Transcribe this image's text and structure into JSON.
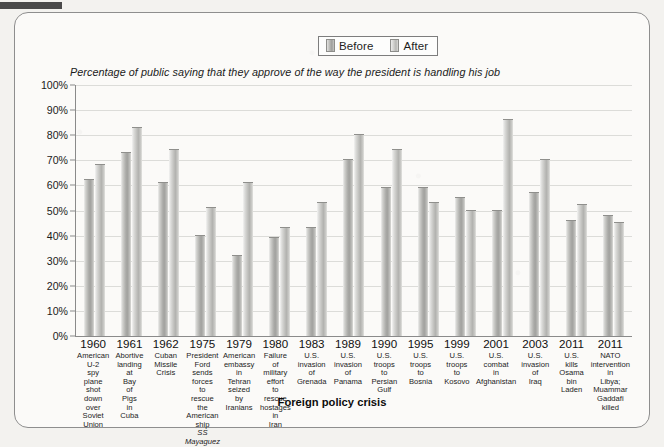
{
  "figure": {
    "subtitle": "Percentage of public saying that they approve of the way the president is handling his job",
    "xaxis_title": "Foreign policy crisis",
    "legend": [
      {
        "label": "Before",
        "color": "#b0b0ad"
      },
      {
        "label": "After",
        "color": "#c2c2bf"
      }
    ]
  },
  "chart_data": {
    "type": "bar",
    "title": "",
    "subtitle": "Percentage of public saying that they approve of the way the president is handling his job",
    "xlabel": "Foreign policy crisis",
    "ylabel": "",
    "ylim": [
      0,
      100
    ],
    "ytick_labels": [
      "0%",
      "10%",
      "20%",
      "30%",
      "40%",
      "50%",
      "60%",
      "70%",
      "80%",
      "90%",
      "100%"
    ],
    "ytick_values": [
      0,
      10,
      20,
      30,
      40,
      50,
      60,
      70,
      80,
      90,
      100
    ],
    "grid": true,
    "legend_position": "top-center",
    "categories": [
      "1960 American U-2 spy plane shot down over Soviet Union",
      "1961 Abortive landing at Bay of Pigs in Cuba",
      "1962 Cuban Missile Crisis",
      "1975 President Ford sends forces to rescue the American ship SS Mayaguez",
      "1979 American embassy in Tehran seized by Iranians",
      "1980 Failure of military effort to rescue hostages in Iran",
      "1983 U.S. invasion of Grenada",
      "1989 U.S. invasion of Panama",
      "1990 U.S. troops to Persian Gulf",
      "1995 U.S. troops to Bosnia",
      "1999 U.S. troops to Kosovo",
      "2001 U.S. combat in Afghanistan",
      "2003 U.S. invasion of Iraq",
      "2011 U.S. kills Osama bin Laden",
      "2011 NATO intervention in Libya; Muammar Gaddafi killed"
    ],
    "category_years": [
      "1960",
      "1961",
      "1962",
      "1975",
      "1979",
      "1980",
      "1983",
      "1989",
      "1990",
      "1995",
      "1999",
      "2001",
      "2003",
      "2011",
      "2011"
    ],
    "category_descriptions": [
      "American U-2 spy plane shot down over Soviet Union",
      "Abortive landing at Bay of Pigs in Cuba",
      "Cuban Missile Crisis",
      "President Ford sends forces to rescue the American ship SS Mayaguez",
      "American embassy in Tehran seized by Iranians",
      "Failure of military effort to rescue hostages in Iran",
      "U.S. invasion of Grenada",
      "U.S. invasion of Panama",
      "U.S. troops to Persian Gulf",
      "U.S. troops to Bosnia",
      "U.S. troops to Kosovo",
      "U.S. combat in Afghanistan",
      "U.S. invasion of Iraq",
      "U.S. kills Osama bin Laden",
      "NATO intervention in Libya; Muammar Gaddafi killed"
    ],
    "series": [
      {
        "name": "Before",
        "values": [
          62,
          73,
          61,
          40,
          32,
          39,
          43,
          70,
          59,
          59,
          55,
          50,
          57,
          46,
          48
        ]
      },
      {
        "name": "After",
        "values": [
          68,
          83,
          74,
          51,
          61,
          43,
          53,
          80,
          74,
          53,
          50,
          86,
          70,
          52,
          45
        ]
      }
    ]
  }
}
